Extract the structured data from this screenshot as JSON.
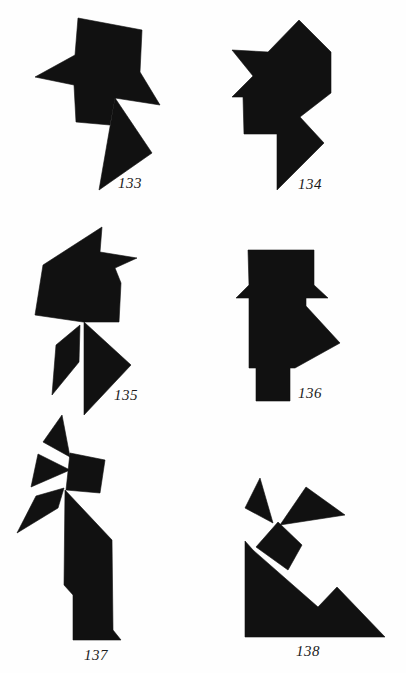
{
  "page": {
    "width": 406,
    "height": 673,
    "background": "#fefefe",
    "ink": "#111111"
  },
  "figures": [
    {
      "number": "133",
      "label_pos": [
        118,
        176
      ],
      "pieces": [
        [
          [
            78,
            18
          ],
          [
            142,
            30
          ],
          [
            140,
            72
          ],
          [
            160,
            105
          ],
          [
            115,
            98
          ],
          [
            110,
            125
          ],
          [
            76,
            122
          ],
          [
            74,
            85
          ],
          [
            35,
            77
          ],
          [
            75,
            55
          ]
        ],
        [
          [
            115,
            98
          ],
          [
            152,
            153
          ],
          [
            99,
            190
          ]
        ]
      ]
    },
    {
      "number": "134",
      "label_pos": [
        298,
        177
      ],
      "pieces": [
        [
          [
            299,
            20
          ],
          [
            331,
            52
          ],
          [
            331,
            93
          ],
          [
            300,
            117
          ],
          [
            324,
            143
          ],
          [
            277,
            190
          ],
          [
            277,
            134
          ],
          [
            244,
            134
          ],
          [
            243,
            97
          ],
          [
            232,
            97
          ],
          [
            253,
            76
          ],
          [
            232,
            50
          ],
          [
            268,
            52
          ]
        ]
      ]
    },
    {
      "number": "135",
      "label_pos": [
        114,
        388
      ],
      "pieces": [
        [
          [
            102,
            227
          ],
          [
            100,
            252
          ],
          [
            137,
            258
          ],
          [
            115,
            268
          ],
          [
            121,
            283
          ],
          [
            119,
            322
          ],
          [
            83,
            322
          ],
          [
            35,
            315
          ],
          [
            43,
            265
          ]
        ],
        [
          [
            80,
            325
          ],
          [
            79,
            362
          ],
          [
            52,
            395
          ],
          [
            56,
            345
          ]
        ],
        [
          [
            84,
            322
          ],
          [
            131,
            365
          ],
          [
            84,
            415
          ]
        ]
      ]
    },
    {
      "number": "136",
      "label_pos": [
        298,
        386
      ],
      "pieces": [
        [
          [
            248,
            250
          ],
          [
            314,
            250
          ],
          [
            314,
            285
          ],
          [
            328,
            298
          ],
          [
            306,
            298
          ],
          [
            306,
            306
          ],
          [
            340,
            343
          ],
          [
            295,
            368
          ],
          [
            290,
            368
          ],
          [
            290,
            401
          ],
          [
            256,
            401
          ],
          [
            256,
            368
          ],
          [
            249,
            368
          ],
          [
            249,
            298
          ],
          [
            236,
            298
          ],
          [
            249,
            285
          ]
        ]
      ]
    },
    {
      "number": "137",
      "label_pos": [
        84,
        648
      ],
      "pieces": [
        [
          [
            62,
            415
          ],
          [
            70,
            457
          ],
          [
            43,
            442
          ]
        ],
        [
          [
            38,
            454
          ],
          [
            70,
            470
          ],
          [
            31,
            487
          ]
        ],
        [
          [
            70,
            453
          ],
          [
            105,
            460
          ],
          [
            100,
            493
          ],
          [
            66,
            490
          ]
        ],
        [
          [
            64,
            488
          ],
          [
            58,
            508
          ],
          [
            17,
            533
          ],
          [
            36,
            496
          ]
        ],
        [
          [
            65,
            490
          ],
          [
            112,
            540
          ],
          [
            113,
            630
          ],
          [
            121,
            640
          ],
          [
            73,
            640
          ],
          [
            73,
            595
          ],
          [
            64,
            585
          ]
        ]
      ]
    },
    {
      "number": "138",
      "label_pos": [
        296,
        644
      ],
      "pieces": [
        [
          [
            260,
            478
          ],
          [
            273,
            523
          ],
          [
            245,
            508
          ]
        ],
        [
          [
            306,
            487
          ],
          [
            345,
            515
          ],
          [
            280,
            525
          ]
        ],
        [
          [
            278,
            522
          ],
          [
            302,
            545
          ],
          [
            288,
            570
          ],
          [
            256,
            547
          ]
        ],
        [
          [
            245,
            541
          ],
          [
            253,
            550
          ],
          [
            318,
            607
          ],
          [
            337,
            587
          ],
          [
            385,
            637
          ],
          [
            245,
            637
          ]
        ]
      ]
    }
  ]
}
